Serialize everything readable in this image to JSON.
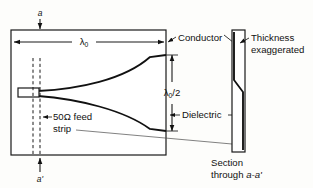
{
  "figure": {
    "labels": {
      "section_top": "a",
      "section_bottom": "a'",
      "lambda0": "λ",
      "lambda0_sub": "0",
      "lambda_half": "λ",
      "lambda_half_sub": "0",
      "lambda_half_rest": "/2",
      "conductor": "Conductor",
      "dielectric": "Dielectric",
      "feed_line1": "50Ω feed",
      "feed_line2": "strip",
      "thickness_line1": "Thickness",
      "thickness_line2": "exaggerated",
      "section_line1": "Section",
      "section_line2_prefix": "through ",
      "section_line2_ital": "a-a'"
    },
    "colors": {
      "ink": "#111111",
      "paper": "#fdfdfb",
      "leader": "#4a4a4a"
    },
    "geometry": {
      "board": {
        "x": 11,
        "y": 30,
        "width": 155,
        "height": 125
      },
      "section_bar": {
        "x": 232,
        "y": 30,
        "width": 13,
        "height": 122
      },
      "feed_strip": {
        "x": 18,
        "y": 88,
        "width": 21,
        "height": 9
      },
      "lambda0_dim_y": 42,
      "lambda_half_dim_x": 172,
      "flare_top_end_y": 55,
      "flare_bottom_end_y": 131
    }
  }
}
